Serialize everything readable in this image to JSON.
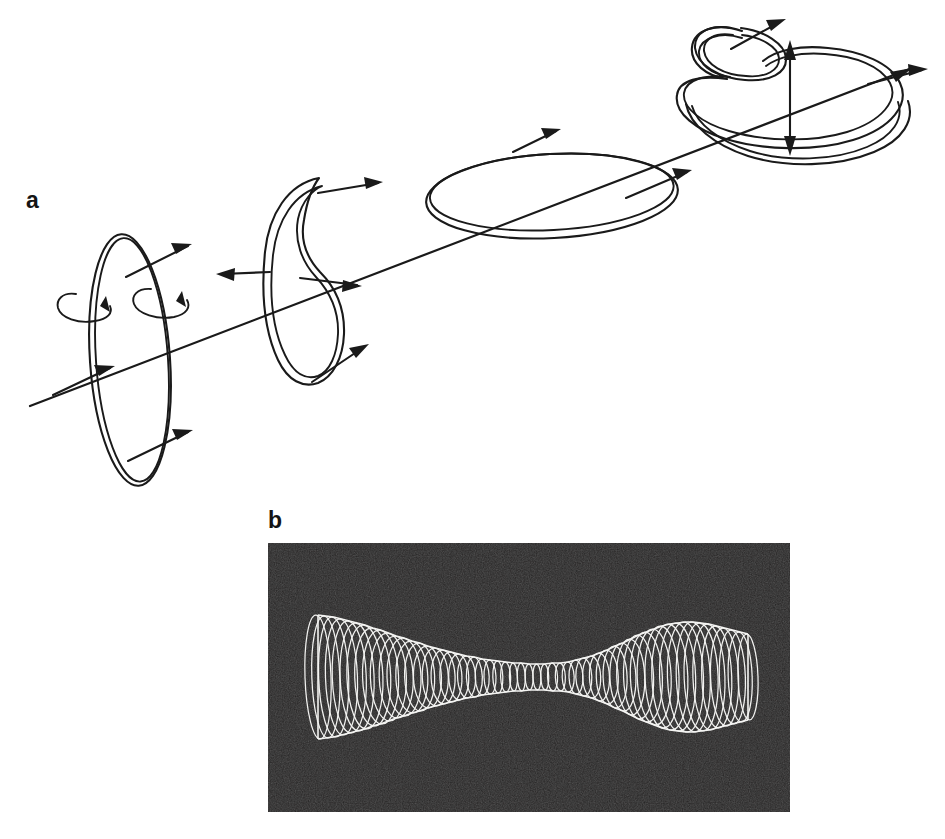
{
  "figure": {
    "type": "scientific-diagram",
    "background_color": "#ffffff",
    "ink_color": "#1a1a1a",
    "width": 945,
    "height": 839
  },
  "panels": [
    {
      "id": "a",
      "label": "a",
      "label_position": {
        "x": 26,
        "y": 189
      },
      "description": "optical-axis with four ring-mode shapes",
      "axis": {
        "name": "optical-axis",
        "start": {
          "x": 30,
          "y": 406
        },
        "end": {
          "x": 912,
          "y": 68
        },
        "arrow_at_end": true
      },
      "elements": [
        {
          "name": "circular-ring",
          "order": 1,
          "center": {
            "x": 130,
            "y": 360
          },
          "rx": 41,
          "ry": 126,
          "rotation_deg": -4,
          "ribbon": true,
          "radial_arrows": 2,
          "rotation_arrows": 2
        },
        {
          "name": "crescent-bent-ribbon",
          "order": 2,
          "center": {
            "x": 300,
            "y": 288
          },
          "radial_arrows": 3
        },
        {
          "name": "flat-horizontal-ring",
          "order": 3,
          "center": {
            "x": 552,
            "y": 196
          },
          "rx": 126,
          "ry": 42,
          "ribbon": true,
          "radial_arrows": 2
        },
        {
          "name": "twisted-folded-ribbon",
          "order": 4,
          "center": {
            "x": 800,
            "y": 85
          },
          "has_small_loop": true,
          "radial_arrows": 2,
          "double_headed_vertical_arrow": true
        }
      ]
    },
    {
      "id": "b",
      "label": "b",
      "label_position": {
        "x": 268,
        "y": 509
      },
      "description": "grayscale photograph of beam waist ellipse stack",
      "frame": {
        "x": 268,
        "y": 543,
        "width": 522,
        "height": 269
      },
      "background_color": "#1d1c1c",
      "stroke_color": "#f2f2f0"
    }
  ],
  "chart_data": {
    "type": "line",
    "title": "",
    "xlabel": "",
    "ylabel": "",
    "n_ellipses": 56,
    "x_start": 318,
    "x_end": 748,
    "center_y": 677,
    "xlim": [
      318,
      748
    ],
    "ylim": [
      609,
      745
    ],
    "envelope_half_height": [
      62,
      61,
      60,
      58,
      56,
      54,
      52,
      49,
      47,
      44,
      41,
      39,
      36,
      34,
      31,
      29,
      27,
      25,
      23,
      21,
      20,
      18,
      17,
      16,
      15,
      14,
      14,
      13,
      13,
      13,
      14,
      14,
      15,
      17,
      19,
      21,
      24,
      27,
      31,
      34,
      38,
      42,
      45,
      48,
      51,
      53,
      54,
      55,
      55,
      54,
      53,
      51,
      49,
      47,
      45,
      43
    ],
    "ellipse_half_width": [
      13,
      14,
      15,
      16,
      17,
      17,
      18,
      18,
      18,
      18,
      17,
      17,
      16,
      15,
      14,
      13,
      12,
      11,
      10,
      9,
      8,
      7,
      6,
      5,
      5,
      4,
      4,
      4,
      4,
      4,
      5,
      5,
      6,
      7,
      8,
      9,
      10,
      11,
      12,
      13,
      14,
      15,
      16,
      17,
      17,
      18,
      18,
      18,
      17,
      17,
      16,
      15,
      14,
      13,
      12,
      10
    ],
    "grid": false,
    "legend": null
  }
}
